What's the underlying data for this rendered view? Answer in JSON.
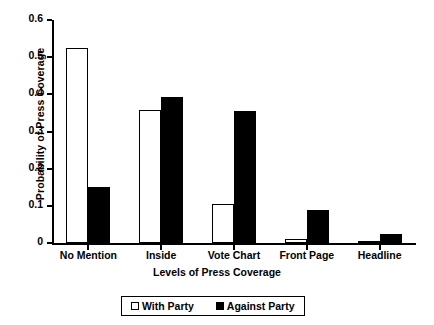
{
  "chart_data": {
    "type": "bar",
    "title": "",
    "xlabel": "Levels of Press Coverage",
    "ylabel": "Probability of  Press Coverage",
    "categories": [
      "No Mention",
      "Inside",
      "Vote Chart",
      "Front Page",
      "Headline"
    ],
    "series": [
      {
        "name": "With Party",
        "color": "#ffffff",
        "values": [
          0.524,
          0.357,
          0.105,
          0.012,
          0.003
        ]
      },
      {
        "name": "Against Party",
        "color": "#000000",
        "values": [
          0.15,
          0.392,
          0.355,
          0.09,
          0.025
        ]
      }
    ],
    "ylim": [
      0,
      0.6
    ],
    "yticks": [
      "0",
      "0.1",
      "0.2",
      "0.3",
      "0.4",
      "0.5",
      "0.6"
    ],
    "ytick_values": [
      0,
      0.1,
      0.2,
      0.3,
      0.4,
      0.5,
      0.6
    ],
    "grid": false,
    "legend_position": "bottom"
  },
  "legend": {
    "items": [
      {
        "label": "With Party",
        "swatch": "open-square-icon"
      },
      {
        "label": "Against Party",
        "swatch": "filled-square-icon"
      }
    ]
  }
}
